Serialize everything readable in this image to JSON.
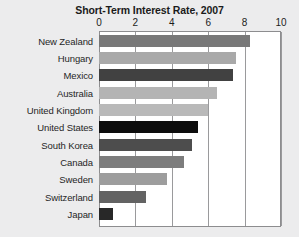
{
  "chart_data": {
    "type": "bar",
    "orientation": "horizontal",
    "title": "Short-Term Interest Rate, 2007",
    "xlabel": "",
    "ylabel": "",
    "xlim": [
      0,
      10
    ],
    "xticks": [
      0,
      2,
      4,
      6,
      8,
      10
    ],
    "xtick_labels": [
      "0",
      "2",
      "4",
      "6",
      "8",
      "10"
    ],
    "grid": "vertical",
    "legend": "none",
    "categories": [
      "New Zealand",
      "Hungary",
      "Mexico",
      "Australia",
      "United Kingdom",
      "United States",
      "South Korea",
      "Canada",
      "Sweden",
      "Switzerland",
      "Japan"
    ],
    "values": [
      8.3,
      7.5,
      7.35,
      6.5,
      6.0,
      5.45,
      5.1,
      4.65,
      3.75,
      2.6,
      0.75
    ],
    "bar_colors": [
      "#787878",
      "#a9a9a9",
      "#414141",
      "#b4b4b4",
      "#b9b9b9",
      "#0d0d0d",
      "#4d4d4d",
      "#7d7d7d",
      "#9d9d9d",
      "#636363",
      "#282828"
    ]
  },
  "style": {
    "page_background": "#ececed",
    "plot_background": "#ffffff",
    "gridline_color": "#9a9a9c",
    "frame_color": "#8d8d8f",
    "title_color": "#1b1b1b",
    "label_color": "#262626"
  }
}
